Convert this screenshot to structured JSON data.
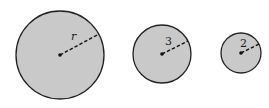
{
  "colors": {
    "background": "#ffffff",
    "circle_fill": "#c9c9c9",
    "circle_stroke": "#222222",
    "radius_line": "#111111"
  },
  "circles": [
    {
      "id": "large",
      "cx": 60,
      "cy": 55,
      "r": 44,
      "label": "r",
      "label_x": 71,
      "label_y": 40,
      "italic": true,
      "line_end_x": 99,
      "line_end_y": 34
    },
    {
      "id": "medium",
      "cx": 162,
      "cy": 54,
      "r": 29,
      "label": "3",
      "label_x": 165,
      "label_y": 45,
      "italic": false,
      "line_end_x": 188,
      "line_end_y": 41
    },
    {
      "id": "small",
      "cx": 241,
      "cy": 53,
      "r": 20,
      "label": "2",
      "label_x": 240,
      "label_y": 47,
      "italic": false,
      "line_end_x": 259,
      "line_end_y": 44
    }
  ]
}
